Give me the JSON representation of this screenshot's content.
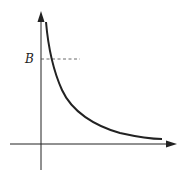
{
  "diagram": {
    "type": "function-graph",
    "curve": "decreasing hyperbola-like curve approaching x-axis",
    "labels": {
      "b_label": "B"
    },
    "colors": {
      "axis": "#222222",
      "curve": "#222222",
      "dashed": "#444444"
    }
  }
}
